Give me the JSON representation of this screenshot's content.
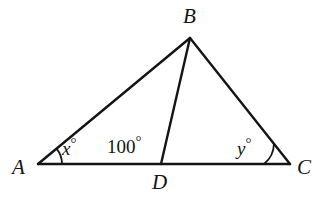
{
  "figure": {
    "background_color": "#ffffff",
    "stroke_color": "#141414",
    "stroke_width": 2,
    "width": 328,
    "height": 202
  },
  "vertices": [
    {
      "id": "A",
      "label": "A",
      "x": 38,
      "y": 164
    },
    {
      "id": "B",
      "label": "B",
      "x": 190,
      "y": 38
    },
    {
      "id": "C",
      "label": "C",
      "x": 290,
      "y": 164
    },
    {
      "id": "D",
      "label": "D",
      "x": 161,
      "y": 164
    }
  ],
  "segments": [
    {
      "name": "AB",
      "from": "A",
      "to": "B"
    },
    {
      "name": "BC",
      "from": "B",
      "to": "C"
    },
    {
      "name": "AC",
      "from": "A",
      "to": "C"
    },
    {
      "name": "BD",
      "from": "B",
      "to": "D"
    }
  ],
  "angle_labels": {
    "at_A": {
      "value": "x",
      "unit": "°",
      "text": "x°"
    },
    "at_D": {
      "value": "100",
      "unit": "°",
      "text": "100°"
    },
    "at_C": {
      "value": "y",
      "unit": "°",
      "text": "y°"
    }
  },
  "angle_arcs": [
    {
      "name": "arc-at-A",
      "vertex": "A"
    },
    {
      "name": "arc-at-C",
      "vertex": "C"
    }
  ]
}
